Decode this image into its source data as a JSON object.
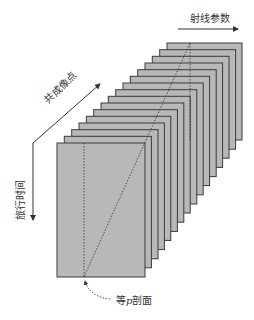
{
  "diagram": {
    "type": "3d-data-cube-stack",
    "panel_count": 16,
    "colors": {
      "panel_fill": "#b8b8b8",
      "panel_stroke": "#3a3a3a",
      "arrow": "#333333",
      "text": "#333333"
    },
    "front_panel": {
      "x": 57,
      "y": 143,
      "w": 88,
      "h": 134
    },
    "back_panel": {
      "x": 167,
      "y": 43,
      "w": 75,
      "h": 97
    }
  },
  "labels": {
    "ray_parameter": "射线参数",
    "common_image_point": "共成像点",
    "travel_time": "旅行时间",
    "equal_p_section_prefix": "等",
    "equal_p_section_var": "p",
    "equal_p_section_suffix": "剖面"
  }
}
